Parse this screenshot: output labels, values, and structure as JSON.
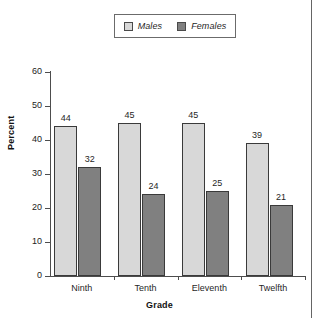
{
  "chart_data": {
    "type": "bar",
    "title": "",
    "subtitle": "",
    "xlabel": "Grade",
    "ylabel": "Percent",
    "categories": [
      "Ninth",
      "Tenth",
      "Eleventh",
      "Twelfth"
    ],
    "series": [
      {
        "name": "Males",
        "values": [
          44,
          45,
          45,
          39
        ],
        "color": "#d8d8d8"
      },
      {
        "name": "Females",
        "values": [
          32,
          24,
          25,
          21
        ],
        "color": "#808080"
      }
    ],
    "ylim": [
      0,
      60
    ],
    "ytick_labels": [
      "0",
      "10",
      "20",
      "30",
      "40",
      "50",
      "60"
    ],
    "ytick_values": [
      0,
      10,
      20,
      30,
      40,
      50,
      60
    ],
    "grid": false,
    "legend_position": "top-center",
    "data_labels": true,
    "annotations": []
  },
  "legend": {
    "entries": [
      {
        "label": "Males",
        "color": "#d8d8d8"
      },
      {
        "label": "Females",
        "color": "#808080"
      }
    ]
  }
}
